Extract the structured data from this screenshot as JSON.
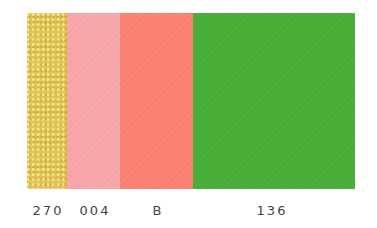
{
  "swatches": [
    {
      "code": "270",
      "color": "#e2c455",
      "description": "gold glitter"
    },
    {
      "code": "004",
      "color": "#f7a9ad",
      "description": "light pink"
    },
    {
      "code": "B",
      "color": "#fb8576",
      "description": "salmon"
    },
    {
      "code": "136",
      "color": "#4cb13b",
      "description": "green"
    }
  ]
}
